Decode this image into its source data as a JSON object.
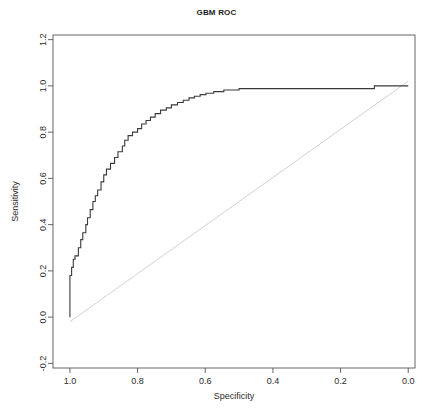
{
  "window": {
    "title": "GBM ROC"
  },
  "chart_data": {
    "type": "line",
    "title": "GBM ROC",
    "xlabel": "Specificity",
    "ylabel": "Sensitivity",
    "xlim": [
      1.05,
      -0.02
    ],
    "ylim": [
      -0.22,
      1.22
    ],
    "x_reversed": true,
    "grid": false,
    "legend": null,
    "xticks": [
      1.0,
      0.8,
      0.6,
      0.4,
      0.2,
      0.0
    ],
    "xtick_labels": [
      "1.0",
      "0.8",
      "0.6",
      "0.4",
      "0.2",
      "0.0"
    ],
    "yticks": [
      -0.2,
      0.0,
      0.2,
      0.4,
      0.6,
      0.8,
      1.0,
      1.2
    ],
    "ytick_labels": [
      "-0.2",
      "0.0",
      "0.2",
      "0.4",
      "0.6",
      "0.8",
      "1.0",
      "1.2"
    ],
    "series": [
      {
        "name": "ROC curve",
        "type": "step",
        "color": "#3a3a3a",
        "width": 1.1,
        "points": [
          [
            1.0,
            0.0
          ],
          [
            1.0,
            0.09
          ],
          [
            1.0,
            0.18
          ],
          [
            0.995,
            0.18
          ],
          [
            0.995,
            0.215
          ],
          [
            0.99,
            0.215
          ],
          [
            0.99,
            0.25
          ],
          [
            0.985,
            0.25
          ],
          [
            0.985,
            0.265
          ],
          [
            0.975,
            0.265
          ],
          [
            0.975,
            0.3
          ],
          [
            0.968,
            0.3
          ],
          [
            0.968,
            0.335
          ],
          [
            0.962,
            0.335
          ],
          [
            0.962,
            0.365
          ],
          [
            0.953,
            0.365
          ],
          [
            0.953,
            0.4
          ],
          [
            0.948,
            0.4
          ],
          [
            0.948,
            0.43
          ],
          [
            0.94,
            0.43
          ],
          [
            0.94,
            0.465
          ],
          [
            0.932,
            0.465
          ],
          [
            0.932,
            0.5
          ],
          [
            0.925,
            0.5
          ],
          [
            0.925,
            0.525
          ],
          [
            0.918,
            0.525
          ],
          [
            0.918,
            0.55
          ],
          [
            0.908,
            0.55
          ],
          [
            0.908,
            0.585
          ],
          [
            0.9,
            0.585
          ],
          [
            0.9,
            0.615
          ],
          [
            0.892,
            0.615
          ],
          [
            0.892,
            0.64
          ],
          [
            0.88,
            0.64
          ],
          [
            0.88,
            0.665
          ],
          [
            0.868,
            0.665
          ],
          [
            0.868,
            0.69
          ],
          [
            0.858,
            0.69
          ],
          [
            0.858,
            0.715
          ],
          [
            0.845,
            0.715
          ],
          [
            0.845,
            0.74
          ],
          [
            0.838,
            0.74
          ],
          [
            0.838,
            0.765
          ],
          [
            0.828,
            0.765
          ],
          [
            0.828,
            0.785
          ],
          [
            0.815,
            0.785
          ],
          [
            0.815,
            0.8
          ],
          [
            0.8,
            0.8
          ],
          [
            0.8,
            0.815
          ],
          [
            0.788,
            0.815
          ],
          [
            0.788,
            0.835
          ],
          [
            0.775,
            0.835
          ],
          [
            0.775,
            0.85
          ],
          [
            0.762,
            0.85
          ],
          [
            0.762,
            0.865
          ],
          [
            0.748,
            0.865
          ],
          [
            0.748,
            0.88
          ],
          [
            0.732,
            0.88
          ],
          [
            0.732,
            0.895
          ],
          [
            0.715,
            0.895
          ],
          [
            0.715,
            0.905
          ],
          [
            0.7,
            0.905
          ],
          [
            0.7,
            0.918
          ],
          [
            0.682,
            0.918
          ],
          [
            0.682,
            0.928
          ],
          [
            0.665,
            0.928
          ],
          [
            0.665,
            0.938
          ],
          [
            0.648,
            0.938
          ],
          [
            0.648,
            0.948
          ],
          [
            0.632,
            0.948
          ],
          [
            0.632,
            0.955
          ],
          [
            0.615,
            0.955
          ],
          [
            0.615,
            0.962
          ],
          [
            0.598,
            0.962
          ],
          [
            0.598,
            0.968
          ],
          [
            0.575,
            0.968
          ],
          [
            0.575,
            0.975
          ],
          [
            0.545,
            0.975
          ],
          [
            0.545,
            0.982
          ],
          [
            0.5,
            0.982
          ],
          [
            0.5,
            0.988
          ],
          [
            0.1,
            0.988
          ],
          [
            0.1,
            1.0
          ],
          [
            0.0,
            1.0
          ]
        ]
      },
      {
        "name": "reference diagonal",
        "type": "line",
        "color": "#cccccc",
        "width": 0.9,
        "points": [
          [
            1.0,
            -0.02
          ],
          [
            0.0,
            1.02
          ]
        ]
      }
    ]
  }
}
